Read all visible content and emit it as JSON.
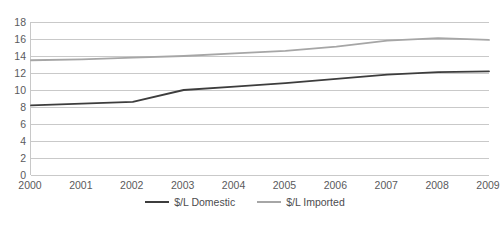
{
  "chart_data": {
    "type": "line",
    "title": "",
    "subtitle": "",
    "xlabel": "",
    "ylabel": "",
    "x": [
      2000,
      2001,
      2002,
      2003,
      2004,
      2005,
      2006,
      2007,
      2008,
      2009
    ],
    "categories": [
      "2000",
      "2001",
      "2002",
      "2003",
      "2004",
      "2005",
      "2006",
      "2007",
      "2008",
      "2009"
    ],
    "series": [
      {
        "name": "$/L Domestic",
        "color": "#3d3d3d",
        "values": [
          8.2,
          8.4,
          8.6,
          10.0,
          10.4,
          10.8,
          11.3,
          11.8,
          12.1,
          12.2
        ]
      },
      {
        "name": "$/L Imported",
        "color": "#a6a6a6",
        "values": [
          13.5,
          13.6,
          13.8,
          14.0,
          14.3,
          14.6,
          15.1,
          15.8,
          16.1,
          15.9
        ]
      }
    ],
    "ylim": [
      0,
      18
    ],
    "ytick_values": [
      18,
      16,
      14,
      12,
      10,
      8,
      6,
      4,
      2,
      0
    ],
    "ytick_labels": [
      "18",
      "16",
      "14",
      "12",
      "10",
      "8",
      "6",
      "4",
      "2",
      "0"
    ],
    "xlim": [
      2000,
      2009
    ],
    "grid": "horizontal",
    "legend_position": "bottom",
    "legend_entries": [
      "$/L Domestic",
      "$/L Imported"
    ],
    "x_axis_clipped_right": true,
    "last_x_label_visible_text": "2009"
  },
  "colors": {
    "domestic_line": "#3d3d3d",
    "imported_line": "#a6a6a6",
    "gridline": "#c9c9c9",
    "axis": "#c8c8c8",
    "tick_text": "#5a5a5c",
    "legend_text": "#4c4c4e",
    "background": "#ffffff"
  }
}
